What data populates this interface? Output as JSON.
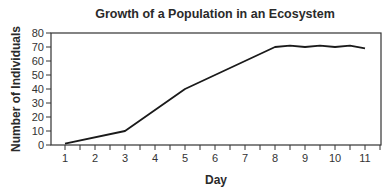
{
  "chart_data": {
    "type": "line",
    "title": "Growth of a Population in an Ecosystem",
    "xlabel": "Day",
    "ylabel": "Number of Individuals",
    "x_ticks": [
      1,
      2,
      3,
      4,
      5,
      6,
      7,
      8,
      9,
      10,
      11
    ],
    "y_ticks": [
      0,
      10,
      20,
      30,
      40,
      50,
      60,
      70,
      80
    ],
    "xlim": [
      0.55,
      11.55
    ],
    "ylim": [
      0,
      80
    ],
    "grid": false,
    "legend": null,
    "series": [
      {
        "name": "Population",
        "x": [
          1,
          3,
          5,
          8,
          8.5,
          9,
          9.5,
          10,
          10.5,
          11
        ],
        "y": [
          1,
          10,
          40,
          70,
          71,
          70,
          71,
          70,
          71,
          69
        ]
      }
    ]
  },
  "style": {
    "line_color": "#1a1a1a",
    "axis_color": "#333333",
    "text_color": "#2a2a2a"
  }
}
